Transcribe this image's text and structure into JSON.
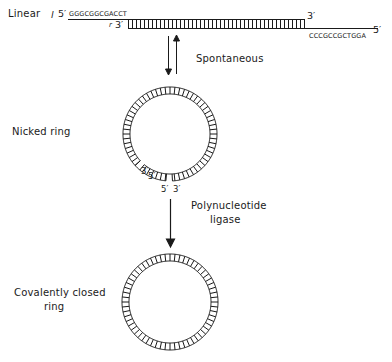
{
  "diagram": {
    "states": {
      "linear": {
        "label": "Linear",
        "left_marks": [
          "l",
          "r"
        ],
        "top_left_end": "5′",
        "bottom_left_end": "3′",
        "top_right_end": "3′",
        "bottom_right_end": "5′",
        "left_cohesive_sequence": "GGGCGGCGACCT",
        "right_cohesive_sequence": "CCCGCCGCTGGA",
        "left_mark_l": "l",
        "left_mark_r": "r"
      },
      "nicked_ring": {
        "label": "Nicked ring",
        "nick1_ends": [
          "3′",
          "5′"
        ],
        "nick2_ends": [
          "5′",
          "3′"
        ]
      },
      "closed_ring": {
        "label_line1": "Covalently closed",
        "label_line2": "ring"
      }
    },
    "transitions": [
      {
        "from": "linear",
        "to": "nicked_ring",
        "label": "Spontaneous",
        "reversible": true
      },
      {
        "from": "nicked_ring",
        "to": "closed_ring",
        "label_line1": "Polynucleotide",
        "label_line2": "ligase",
        "reversible": false
      }
    ],
    "colors": {
      "ink": "#1a1a1a",
      "background": "#ffffff"
    }
  }
}
